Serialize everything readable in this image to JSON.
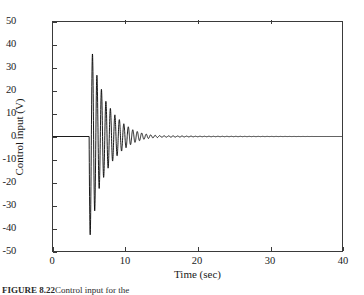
{
  "figure": {
    "background": "#ffffff",
    "line_color": "#000000",
    "axis_color": "#3a3a3a"
  },
  "caption": {
    "label": "FIGURE 8.22",
    "text": "Control input for the"
  },
  "chart_data": {
    "type": "line",
    "title": "",
    "subtitle": "",
    "xlabel": "Time (sec)",
    "ylabel": "Control input (V)",
    "xlim": [
      0,
      40
    ],
    "ylim": [
      -50,
      50
    ],
    "xticks": [
      0,
      10,
      20,
      30,
      40
    ],
    "yticks": [
      50,
      40,
      30,
      20,
      10,
      0,
      -10,
      -20,
      -30,
      -40,
      -50
    ],
    "xticklabels": [
      "0",
      "10",
      "20",
      "30",
      "40"
    ],
    "yticklabels": [
      "50",
      "40",
      "30",
      "20",
      "10",
      "0",
      "-10",
      "-20",
      "-30",
      "-40",
      "-50"
    ],
    "grid": false,
    "legend": null,
    "annotations": [],
    "series": [
      {
        "name": "Control input",
        "color": "#000000",
        "linewidth": 0.9,
        "description": "Zero until t=5 s, then an abrupt damped sinusoidal oscillation: first swing downward to about -48 V, first upward peak about +38 V, envelope decaying exponentially to near zero by t=13 s, then flat at 0 V out to t=40 s.",
        "onset_time": 5.0,
        "settle_time": 13.0,
        "oscillation_period": 0.62,
        "decay_rate": 0.62,
        "peak_positive": 38,
        "peak_negative": -48,
        "envelope_points": [
          {
            "t": 5.0,
            "amp": 48
          },
          {
            "t": 5.3,
            "amp": 38
          },
          {
            "t": 5.9,
            "amp": 31
          },
          {
            "t": 6.2,
            "amp": 24
          },
          {
            "t": 6.8,
            "amp": 20
          },
          {
            "t": 7.2,
            "amp": 16
          },
          {
            "t": 7.8,
            "amp": 13
          },
          {
            "t": 8.4,
            "amp": 10
          },
          {
            "t": 9.0,
            "amp": 8
          },
          {
            "t": 9.6,
            "amp": 6
          },
          {
            "t": 10.3,
            "amp": 4.5
          },
          {
            "t": 11.0,
            "amp": 3
          },
          {
            "t": 11.8,
            "amp": 2
          },
          {
            "t": 12.6,
            "amp": 1.2
          },
          {
            "t": 13.5,
            "amp": 0.7
          },
          {
            "t": 15.0,
            "amp": 0.3
          },
          {
            "t": 20.0,
            "amp": 0.1
          },
          {
            "t": 40.0,
            "amp": 0.0
          }
        ]
      }
    ]
  }
}
